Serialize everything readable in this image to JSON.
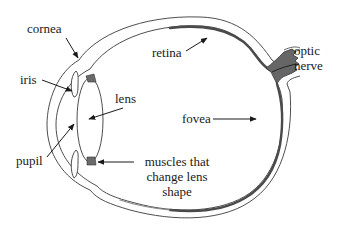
{
  "diagram": {
    "labels": {
      "cornea": "cornea",
      "iris": "iris",
      "lens": "lens",
      "pupil": "pupil",
      "retina": "retina",
      "optic_nerve_line1": "optic",
      "optic_nerve_line2": "nerve",
      "fovea": "fovea",
      "muscles_line1": "muscles that",
      "muscles_line2": "change lens",
      "muscles_line3": "shape"
    },
    "colors": {
      "outline": "#3a3a3a",
      "retina": "#555555",
      "optic_nerve": "#666666",
      "muscle": "#6a6a6a",
      "text": "#1a1a1a",
      "background": "#ffffff"
    }
  }
}
